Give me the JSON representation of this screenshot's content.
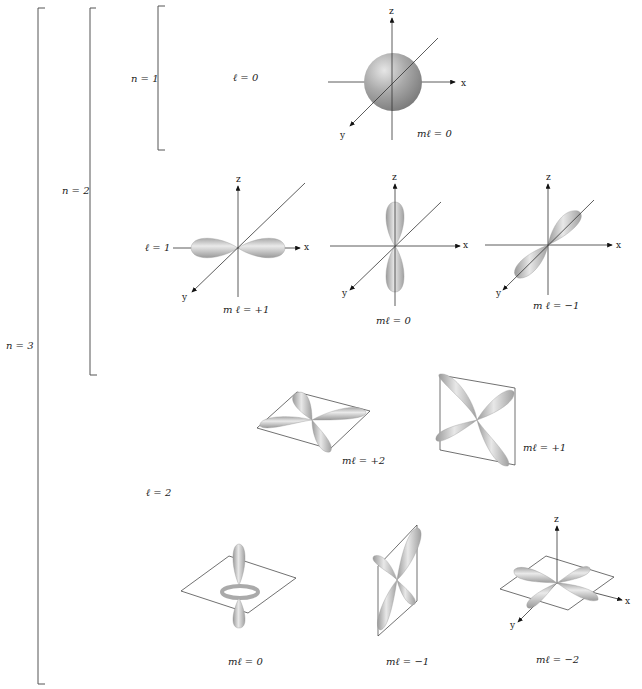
{
  "brackets": [
    {
      "label": "n = 3"
    },
    {
      "label": "n = 2"
    },
    {
      "label": "n = 1"
    }
  ],
  "subshells": {
    "l0": "ℓ = 0",
    "l1": "ℓ = 1",
    "l2": "ℓ = 2"
  },
  "axes": {
    "x": "x",
    "y": "y",
    "z": "z"
  },
  "orbitals": {
    "s": {
      "ml": "mℓ = 0"
    },
    "p_plus1": {
      "ml": "m ℓ = +1"
    },
    "p_0": {
      "ml": "mℓ = 0"
    },
    "p_minus1": {
      "ml": "m ℓ = −1"
    },
    "d_plus2": {
      "ml": "mℓ = +2"
    },
    "d_plus1": {
      "ml": "mℓ = +1"
    },
    "d_0": {
      "ml": "mℓ = 0"
    },
    "d_minus1": {
      "ml": "mℓ = −1"
    },
    "d_minus2": {
      "ml": "mℓ = −2"
    }
  }
}
